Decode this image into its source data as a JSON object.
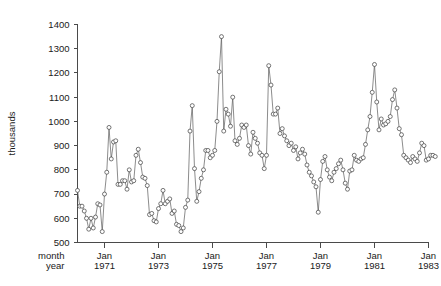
{
  "chart_data": {
    "type": "line",
    "title": "",
    "subtitle": "",
    "xlabel": "",
    "ylabel": "thousands",
    "row_labels": {
      "month": "month",
      "year": "year"
    },
    "ylim": [
      500,
      1400
    ],
    "yticks": [
      500,
      600,
      700,
      800,
      900,
      1000,
      1100,
      1200,
      1300,
      1400
    ],
    "ytick_labels": [
      "500",
      "600",
      "700",
      "800",
      "900",
      "1000",
      "1100",
      "1200",
      "1300",
      "1400"
    ],
    "grid": false,
    "legend": "none",
    "marker": "open-circle",
    "xtick_months": [
      "Jan",
      "Jan",
      "Jan",
      "Jan",
      "Jan",
      "Jan",
      "Jan"
    ],
    "xtick_years": [
      "1971",
      "1973",
      "1975",
      "1977",
      "1979",
      "1981",
      "1983"
    ],
    "xtick_x": [
      1971,
      1973,
      1975,
      1977,
      1979,
      1981,
      1983
    ],
    "xlim": [
      1970.0,
      1983.0
    ],
    "x_unit": "year (monthly observations)",
    "x_start": 1970.0,
    "x_step": 0.08333,
    "values": [
      715,
      650,
      650,
      630,
      600,
      555,
      600,
      560,
      605,
      660,
      655,
      545,
      700,
      790,
      975,
      845,
      915,
      920,
      740,
      740,
      755,
      755,
      720,
      800,
      750,
      755,
      860,
      885,
      830,
      770,
      765,
      735,
      615,
      620,
      590,
      585,
      640,
      660,
      715,
      660,
      670,
      680,
      620,
      630,
      575,
      570,
      545,
      560,
      645,
      675,
      960,
      1065,
      805,
      670,
      710,
      765,
      800,
      880,
      880,
      850,
      860,
      880,
      1000,
      1205,
      1350,
      960,
      1050,
      1030,
      980,
      1100,
      920,
      905,
      930,
      985,
      975,
      985,
      900,
      865,
      955,
      930,
      910,
      870,
      860,
      805,
      860,
      1230,
      1150,
      1030,
      1030,
      1055,
      950,
      970,
      940,
      920,
      900,
      910,
      880,
      895,
      845,
      870,
      885,
      865,
      820,
      790,
      775,
      750,
      730,
      625,
      760,
      835,
      855,
      800,
      770,
      755,
      790,
      805,
      825,
      840,
      800,
      745,
      720,
      795,
      800,
      860,
      840,
      835,
      845,
      850,
      905,
      965,
      1020,
      1120,
      1235,
      1080,
      965,
      1010,
      985,
      990,
      1000,
      1020,
      1090,
      1130,
      1055,
      970,
      945,
      860,
      850,
      840,
      830,
      855,
      845,
      835,
      870,
      910,
      900,
      840,
      845,
      860,
      860,
      855
    ]
  }
}
